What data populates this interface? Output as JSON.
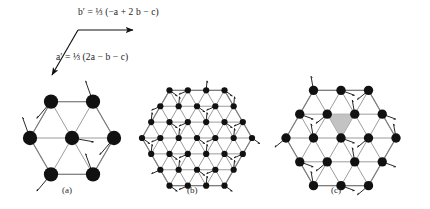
{
  "figure": {
    "background": "#ffffff",
    "lattice_line_color": "#8a8a8a",
    "cell_outline_color": "#7d7d7d",
    "spin_color": "#111111",
    "shaded_triangle_color": "#b9b9b9",
    "arrow_color": "#111111"
  },
  "vectors": {
    "b_prime": {
      "name": "b-prime-definition",
      "text": "b′ = ⅓ (−a + 2 b − c)",
      "lead": "b′",
      "factor": "⅓",
      "expression": "(−a + 2 b − c)",
      "direction": "right",
      "arrow_angle_deg": 0
    },
    "a_prime": {
      "name": "a-prime-definition",
      "text": "a′ = ⅓ (2a − b − c)",
      "lead": "a′",
      "factor": "⅓",
      "expression": "(2a − b − c)",
      "direction": "down-left",
      "arrow_angle_deg": 242
    }
  },
  "panels": [
    {
      "id": "a",
      "caption": "(a)",
      "cell_type": "hexagon",
      "subdivision": 1,
      "description": "hexagonal cell divided by three long diagonals into six triangles",
      "spin_count": 13,
      "shaded_triangle": false
    },
    {
      "id": "b",
      "caption": "(b)",
      "cell_type": "hexagon",
      "subdivision": 3,
      "description": "hexagonal cell with fine triangular mesh, spins on every vertex",
      "spin_count": 37,
      "shaded_triangle": false
    },
    {
      "id": "c",
      "caption": "(c)",
      "cell_type": "hexagon",
      "subdivision": 2,
      "description": "hexagonal cell with triangular mesh and one shaded up-triangle near centre",
      "spin_count": 19,
      "shaded_triangle": true
    }
  ],
  "chart_data": {
    "type": "diagram",
    "title": "",
    "panel_labels": [
      "(a)",
      "(b)",
      "(c)"
    ],
    "annotations": [
      "b′ = ⅓ (−a + 2 b − c)",
      "a′ = ⅓ (2a − b − c)"
    ]
  }
}
